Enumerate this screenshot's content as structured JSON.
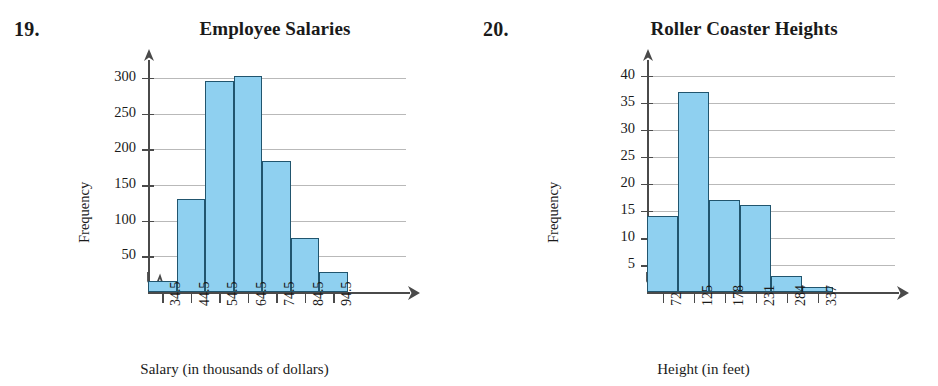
{
  "page": {
    "background_color": "#ffffff",
    "bar_fill_color": "#8fd0f0",
    "bar_stroke_color": "#21556e",
    "gridline_color": "#b9b9b9",
    "axis_color": "#4a4a4a"
  },
  "problems": [
    {
      "number": "19.",
      "title": "Employee Salaries",
      "ylabel": "Frequency",
      "xlabel": "Salary (in thousands of dollars)"
    },
    {
      "number": "20.",
      "title": "Roller Coaster Heights",
      "ylabel": "Frequency",
      "xlabel": "Height (in feet)"
    }
  ],
  "chart_data": [
    {
      "type": "bar",
      "title": "Employee Salaries",
      "xlabel": "Salary (in thousands of dollars)",
      "ylabel": "Frequency",
      "categories": [
        "34.5",
        "44.5",
        "54.5",
        "64.5",
        "74.5",
        "84.5",
        "94.5"
      ],
      "values": [
        15,
        130,
        296,
        302,
        183,
        75,
        28
      ],
      "ytick_labels": [
        "50",
        "100",
        "150",
        "200",
        "250",
        "300"
      ],
      "ytick_values": [
        50,
        100,
        150,
        200,
        250,
        300
      ],
      "ylim": [
        0,
        325
      ],
      "grid": true,
      "y_axis_break": true,
      "legend": "none"
    },
    {
      "type": "bar",
      "title": "Roller Coaster Heights",
      "xlabel": "Height (in feet)",
      "ylabel": "Frequency",
      "categories": [
        "72",
        "125",
        "178",
        "231",
        "284",
        "337"
      ],
      "values": [
        14,
        37,
        17,
        16,
        3,
        1
      ],
      "ytick_labels": [
        "5",
        "10",
        "15",
        "20",
        "25",
        "30",
        "35",
        "40"
      ],
      "ytick_values": [
        5,
        10,
        15,
        20,
        25,
        30,
        35,
        40
      ],
      "ylim": [
        0,
        44
      ],
      "grid": true,
      "y_axis_break": true,
      "legend": "none"
    }
  ]
}
